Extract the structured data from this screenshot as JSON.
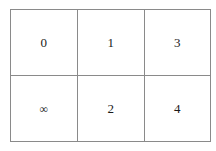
{
  "document": {
    "type": "table",
    "rows": 2,
    "columns": 3,
    "background_color": "#ffffff",
    "border_color": "#8a8a8a",
    "text_color": "#1a1a1a"
  },
  "table": {
    "cells": [
      [
        {
          "text": "0",
          "kind": "digit"
        },
        {
          "text": "1",
          "kind": "digit"
        },
        {
          "text": "3",
          "kind": "digit"
        }
      ],
      [
        {
          "text": "∞",
          "kind": "symbol",
          "name": "infinity-symbol"
        },
        {
          "text": "2",
          "kind": "digit"
        },
        {
          "text": "4",
          "kind": "digit"
        }
      ]
    ]
  }
}
